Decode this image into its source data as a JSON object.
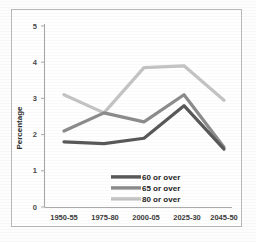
{
  "chart_data": {
    "type": "line",
    "title": "",
    "xlabel": "",
    "ylabel": "Percentage",
    "categories": [
      "1950-55",
      "1975-80",
      "2000-05",
      "2025-30",
      "2045-50"
    ],
    "ylim": [
      0,
      5
    ],
    "yticks": [
      0,
      1,
      2,
      3,
      4,
      5
    ],
    "grid": false,
    "legend_position": "inside-bottom-center",
    "series": [
      {
        "name": "60 or over",
        "color": "#595959",
        "values": [
          1.8,
          1.75,
          1.9,
          2.8,
          1.6
        ]
      },
      {
        "name": "65 or over",
        "color": "#8c8c8c",
        "values": [
          2.1,
          2.6,
          2.35,
          3.1,
          1.65
        ]
      },
      {
        "name": "80 or over",
        "color": "#c4c4c4",
        "values": [
          3.1,
          2.6,
          3.85,
          3.9,
          2.95
        ]
      }
    ]
  },
  "axis": {
    "y_label": "Percentage",
    "y_tick_labels": [
      "5",
      "4",
      "3",
      "2",
      "1",
      "0"
    ],
    "x_tick_labels": [
      "1950-55",
      "1975-80",
      "2000-05",
      "2025-30",
      "2045-50"
    ]
  },
  "legend": {
    "entries": [
      {
        "label": "60 or over",
        "color": "#595959"
      },
      {
        "label": "65 or over",
        "color": "#8c8c8c"
      },
      {
        "label": "80 or over",
        "color": "#c4c4c4"
      }
    ]
  },
  "colors": {
    "axis_line": "#a8a8a8",
    "frame": "#b9b9b9",
    "background": "#ffffff",
    "series_60": "#595959",
    "series_65": "#8c8c8c",
    "series_80": "#c4c4c4"
  }
}
